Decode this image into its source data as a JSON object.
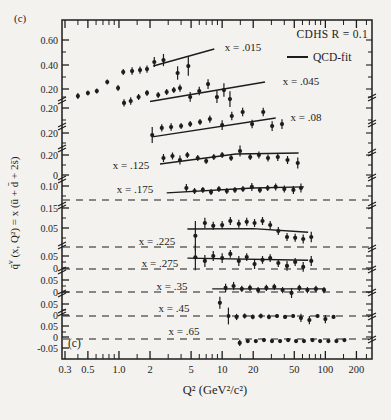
{
  "figure": {
    "panel_label_top": "(c)",
    "panel_label_inner": "(c)"
  },
  "legend": {
    "experiment": "CDHS  R = 0.1",
    "fit_label": "QCD-fit"
  },
  "axes": {
    "x": {
      "title": "Q² (GeV²/c²)",
      "scale": "log",
      "range": [
        0.27,
        265
      ],
      "major_ticks": [
        0.3,
        0.5,
        1.0,
        2,
        5,
        10,
        20,
        50,
        100,
        200
      ],
      "major_tick_labels": [
        "0.3",
        "0.5",
        "1.0",
        "2",
        "5",
        "10",
        "20",
        "50",
        "100",
        "200"
      ],
      "minor_ticks": [
        0.4,
        0.6,
        0.7,
        0.8,
        0.9,
        1.5,
        3,
        4,
        6,
        7,
        8,
        9,
        15,
        30,
        40,
        60,
        70,
        80,
        90,
        150,
        250
      ]
    },
    "y": {
      "title_main": "q̄",
      "title_sup": "ν",
      "title_rest": " (x, Q²) = x (ū + d̄ + 2s̄)",
      "broken_axis": true,
      "tick_labels": [
        {
          "text": "0.60",
          "y": 40
        },
        {
          "text": "0.40",
          "y": 65
        },
        {
          "text": "0.20",
          "y": 89
        },
        {
          "text": "0.20",
          "y": 108
        },
        {
          "text": "0.20",
          "y": 133
        },
        {
          "text": "0.20",
          "y": 155
        },
        {
          "text": "0",
          "y": 175
        },
        {
          "text": "0.10",
          "y": 186
        },
        {
          "text": "0.15",
          "y": 208
        },
        {
          "text": "0.05",
          "y": 228
        },
        {
          "text": "0.05",
          "y": 256
        },
        {
          "text": "0",
          "y": 268
        },
        {
          "text": "0.05",
          "y": 280
        },
        {
          "text": "0",
          "y": 292
        },
        {
          "text": "0.05",
          "y": 304
        },
        {
          "text": "0",
          "y": 315
        },
        {
          "text": "0.05",
          "y": 326
        },
        {
          "text": "0",
          "y": 337
        },
        {
          "text": "-0.05",
          "y": 348
        }
      ]
    }
  },
  "layout": {
    "box": {
      "left": 62,
      "top": 20,
      "right": 372,
      "bottom": 359
    },
    "x_map": {
      "q0": 0.3,
      "x0_px": 65,
      "px_per_decade": 103.2
    },
    "ink": "#1c1c1c",
    "dashed_zero_lines_y": [
      200,
      247,
      269,
      292,
      316,
      339
    ],
    "left_breaks_y": [
      100,
      126,
      148,
      179,
      205,
      245,
      270,
      293,
      312
    ],
    "right_breaks_y": [
      97,
      123,
      152,
      177,
      205,
      248,
      269,
      292,
      316,
      339
    ],
    "y_minor_ticks": [
      52,
      77,
      97,
      120,
      143,
      165,
      196,
      218,
      238,
      262,
      286,
      310,
      332
    ]
  },
  "chart_data": {
    "type": "scatter",
    "xlabel": "Q² (GeV²/c²)",
    "ylabel": "q̄ν(x, Q²) = x(ū + d̄ + 2s̄)",
    "series": [
      {
        "label": "x = .015",
        "label_pos": [
          243,
          51
        ],
        "band": {
          "zero_y": 113,
          "px_per_unit": 122
        },
        "fit_line": [
          [
            2.15,
            0.385
          ],
          [
            8.4,
            0.525
          ]
        ],
        "points": [
          [
            0.4,
            0.139,
            0.025
          ],
          [
            0.5,
            0.164,
            0.02
          ],
          [
            0.61,
            0.18,
            0.02
          ],
          [
            0.77,
            0.254,
            0.02
          ],
          [
            0.98,
            0.205,
            0.025
          ],
          [
            1.1,
            0.336,
            0.025
          ],
          [
            1.34,
            0.344,
            0.03
          ],
          [
            1.6,
            0.352,
            0.03
          ],
          [
            1.87,
            0.36,
            0.03
          ],
          [
            2.2,
            0.418,
            0.04
          ],
          [
            2.7,
            0.434,
            0.05
          ],
          [
            3.7,
            0.328,
            0.055
          ],
          [
            4.7,
            0.385,
            0.08
          ]
        ]
      },
      {
        "label": "x = .045",
        "label_pos": [
          301,
          85
        ],
        "band": {
          "zero_y": 132,
          "px_per_unit": 122
        },
        "fit_line": [
          [
            2.0,
            0.25
          ],
          [
            26,
            0.41
          ]
        ],
        "points": [
          [
            1.12,
            0.238,
            0.03
          ],
          [
            1.3,
            0.254,
            0.03
          ],
          [
            1.55,
            0.287,
            0.025
          ],
          [
            1.87,
            0.32,
            0.025
          ],
          [
            2.4,
            0.303,
            0.025
          ],
          [
            2.9,
            0.328,
            0.025
          ],
          [
            3.4,
            0.344,
            0.025
          ],
          [
            3.9,
            0.36,
            0.03
          ],
          [
            4.9,
            0.287,
            0.04
          ],
          [
            6.0,
            0.336,
            0.035
          ],
          [
            7.3,
            0.393,
            0.04
          ],
          [
            8.9,
            0.287,
            0.05
          ],
          [
            10.4,
            0.344,
            0.055
          ],
          [
            11.9,
            0.27,
            0.065
          ]
        ]
      },
      {
        "label": "x = .08",
        "label_pos": [
          306,
          121
        ],
        "band": {
          "zero_y": 157,
          "px_per_unit": 122
        },
        "fit_line": [
          [
            2.1,
            0.165
          ],
          [
            33,
            0.32
          ]
        ],
        "points": [
          [
            2.1,
            0.18,
            0.065
          ],
          [
            2.6,
            0.238,
            0.03
          ],
          [
            3.2,
            0.246,
            0.03
          ],
          [
            4.0,
            0.254,
            0.025
          ],
          [
            4.9,
            0.27,
            0.025
          ],
          [
            6.1,
            0.287,
            0.025
          ],
          [
            7.6,
            0.311,
            0.03
          ],
          [
            10.0,
            0.262,
            0.04
          ],
          [
            12.4,
            0.336,
            0.035
          ],
          [
            15.8,
            0.369,
            0.035
          ],
          [
            19.5,
            0.27,
            0.035
          ],
          [
            25.0,
            0.369,
            0.035
          ],
          [
            30.5,
            0.254,
            0.04
          ],
          [
            38.0,
            0.27,
            0.04
          ]
        ]
      },
      {
        "label": "x = .125",
        "label_pos": [
          131,
          169
        ],
        "band": {
          "zero_y": 175,
          "px_per_unit": 100
        },
        "fit_line": [
          [
            2.5,
            0.11
          ],
          [
            13.6,
            0.21
          ],
          [
            55,
            0.22
          ]
        ],
        "points": [
          [
            2.7,
            0.17,
            0.04
          ],
          [
            3.3,
            0.19,
            0.035
          ],
          [
            3.9,
            0.15,
            0.045
          ],
          [
            4.6,
            0.2,
            0.03
          ],
          [
            5.8,
            0.17,
            0.03
          ],
          [
            7.0,
            0.14,
            0.03
          ],
          [
            8.3,
            0.18,
            0.03
          ],
          [
            10.0,
            0.2,
            0.03
          ],
          [
            12.2,
            0.17,
            0.03
          ],
          [
            14.9,
            0.24,
            0.055
          ],
          [
            18.7,
            0.18,
            0.03
          ],
          [
            22.7,
            0.2,
            0.035
          ],
          [
            27.8,
            0.17,
            0.035
          ],
          [
            34.6,
            0.18,
            0.04
          ],
          [
            43.0,
            0.15,
            0.04
          ],
          [
            54.0,
            0.12,
            0.055
          ]
        ]
      },
      {
        "label": "x = .175",
        "label_pos": [
          135,
          193
        ],
        "band": {
          "zero_y": 200,
          "px_per_unit": 150
        },
        "fit_line": [
          [
            2.9,
            0.047
          ],
          [
            20,
            0.08
          ],
          [
            62,
            0.087
          ]
        ],
        "points": [
          [
            4.5,
            0.08,
            0.027
          ],
          [
            5.4,
            0.06,
            0.02
          ],
          [
            6.5,
            0.067,
            0.02
          ],
          [
            7.8,
            0.053,
            0.02
          ],
          [
            9.3,
            0.073,
            0.02
          ],
          [
            11.1,
            0.06,
            0.02
          ],
          [
            13.3,
            0.067,
            0.02
          ],
          [
            15.9,
            0.073,
            0.02
          ],
          [
            19.4,
            0.087,
            0.027
          ],
          [
            23.2,
            0.067,
            0.02
          ],
          [
            27.6,
            0.08,
            0.02
          ],
          [
            33.0,
            0.087,
            0.023
          ],
          [
            40.0,
            0.073,
            0.023
          ],
          [
            49.0,
            0.067,
            0.027
          ],
          [
            58.0,
            0.08,
            0.03
          ]
        ]
      },
      {
        "label": "x = .225",
        "label_pos": [
          157,
          245
        ],
        "band": {
          "zero_y": 247,
          "px_per_unit": 400
        },
        "fit_line": [
          [
            4.6,
            0.045
          ],
          [
            20,
            0.046
          ],
          [
            68,
            0.037
          ]
        ],
        "points": [
          [
            5.5,
            0.028,
            0.037
          ],
          [
            6.8,
            0.06,
            0.013
          ],
          [
            8.2,
            0.053,
            0.01
          ],
          [
            10.0,
            0.055,
            0.01
          ],
          [
            12.0,
            0.065,
            0.01
          ],
          [
            14.5,
            0.058,
            0.01
          ],
          [
            17.3,
            0.063,
            0.01
          ],
          [
            20.6,
            0.06,
            0.01
          ],
          [
            24.6,
            0.065,
            0.01
          ],
          [
            29.2,
            0.055,
            0.01
          ],
          [
            35.0,
            0.04,
            0.01
          ],
          [
            42.5,
            0.025,
            0.01
          ],
          [
            51.0,
            0.023,
            0.01
          ],
          [
            61.0,
            0.02,
            0.011
          ],
          [
            73.0,
            0.025,
            0.013
          ]
        ]
      },
      {
        "label": "x = .275",
        "label_pos": [
          160,
          267
        ],
        "band": {
          "zero_y": 269,
          "px_per_unit": 260
        },
        "fit_line": [
          [
            4.6,
            0.042
          ],
          [
            68,
            0.034
          ]
        ],
        "points": [
          [
            5.5,
            0.045,
            0.05
          ],
          [
            6.8,
            0.031,
            0.023
          ],
          [
            8.2,
            0.05,
            0.019
          ],
          [
            10.0,
            0.042,
            0.019
          ],
          [
            12.0,
            0.058,
            0.015
          ],
          [
            14.5,
            0.031,
            0.019
          ],
          [
            17.3,
            0.046,
            0.015
          ],
          [
            20.6,
            0.019,
            0.019
          ],
          [
            24.6,
            0.035,
            0.015
          ],
          [
            29.2,
            0.042,
            0.015
          ],
          [
            35.0,
            0.023,
            0.015
          ],
          [
            42.5,
            0.012,
            0.019
          ],
          [
            51.0,
            0.027,
            0.015
          ],
          [
            61.0,
            0.008,
            0.019
          ],
          [
            73.0,
            0.031,
            0.019
          ]
        ]
      },
      {
        "label": "x = .35",
        "label_pos": [
          172,
          290
        ],
        "band": {
          "zero_y": 292,
          "px_per_unit": 240
        },
        "fit_line": [
          [
            8.0,
            0.013
          ],
          [
            100,
            0.013
          ]
        ],
        "points": [
          [
            10.8,
            0.017,
            0.017
          ],
          [
            12.9,
            0.025,
            0.017
          ],
          [
            15.5,
            0.013,
            0.013
          ],
          [
            18.6,
            0.017,
            0.013
          ],
          [
            22.3,
            0.008,
            0.013
          ],
          [
            26.8,
            0.017,
            0.013
          ],
          [
            32.0,
            0.021,
            0.013
          ],
          [
            38.5,
            0.008,
            0.013
          ],
          [
            47.0,
            -0.004,
            0.021
          ],
          [
            56.0,
            0.017,
            0.013
          ],
          [
            67.0,
            0.008,
            0.013
          ],
          [
            81.0,
            0.013,
            0.013
          ],
          [
            97.0,
            0.008,
            0.013
          ]
        ]
      },
      {
        "label": "x = .45",
        "label_pos": [
          174,
          312
        ],
        "band": {
          "zero_y": 316,
          "px_per_unit": 240
        },
        "fit_line": null,
        "points": [
          [
            9.5,
            0.055,
            0.025
          ],
          [
            11.5,
            0.0,
            0.035
          ],
          [
            13.8,
            -0.004,
            0.013
          ],
          [
            16.5,
            0.0,
            0.01
          ],
          [
            19.8,
            -0.004,
            0.01
          ],
          [
            23.7,
            0.0,
            0.01
          ],
          [
            28.4,
            -0.004,
            0.01
          ],
          [
            34.0,
            0.0,
            0.008
          ],
          [
            40.7,
            -0.004,
            0.008
          ],
          [
            48.7,
            0.0,
            0.008
          ],
          [
            58.0,
            -0.008,
            0.017
          ],
          [
            70.0,
            -0.017,
            0.017
          ],
          [
            84.0,
            0.0,
            0.008
          ],
          [
            100.0,
            -0.013,
            0.017
          ],
          [
            120.0,
            -0.004,
            0.008
          ]
        ]
      },
      {
        "label": "x = .65",
        "label_pos": [
          184,
          335
        ],
        "band": {
          "zero_y": 339,
          "px_per_unit": 260
        },
        "fit_line": null,
        "points": [
          [
            14.8,
            -0.015,
            0.012
          ],
          [
            17.7,
            -0.008,
            0.006
          ],
          [
            21.2,
            -0.008,
            0.006
          ],
          [
            25.4,
            -0.004,
            0.006
          ],
          [
            30.4,
            -0.008,
            0.006
          ],
          [
            36.4,
            -0.008,
            0.006
          ],
          [
            43.6,
            -0.004,
            0.006
          ],
          [
            52.0,
            -0.008,
            0.006
          ],
          [
            62.0,
            -0.008,
            0.006
          ],
          [
            75.0,
            -0.004,
            0.006
          ],
          [
            89.0,
            -0.008,
            0.006
          ],
          [
            107.0,
            -0.008,
            0.006
          ],
          [
            128.0,
            -0.008,
            0.006
          ],
          [
            153.0,
            -0.004,
            0.006
          ]
        ]
      }
    ]
  }
}
